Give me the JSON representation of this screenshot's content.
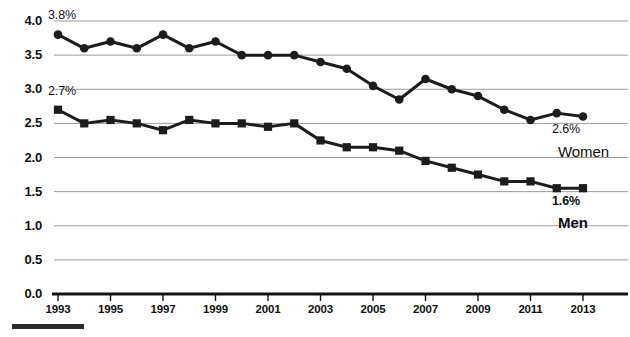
{
  "chart_data": {
    "type": "line",
    "title": "",
    "xlabel": "",
    "ylabel": "",
    "xlim": [
      1993,
      2013
    ],
    "ylim": [
      0.0,
      4.0
    ],
    "grid": true,
    "legend_position": "right-inline",
    "x": [
      1993,
      1994,
      1995,
      1996,
      1997,
      1998,
      1999,
      2000,
      2001,
      2002,
      2003,
      2004,
      2005,
      2006,
      2007,
      2008,
      2009,
      2010,
      2011,
      2012,
      2013
    ],
    "xtick_labels": [
      "1993",
      "1995",
      "1997",
      "1999",
      "2001",
      "2003",
      "2005",
      "2007",
      "2009",
      "2011",
      "2013"
    ],
    "xtick_values": [
      1993,
      1995,
      1997,
      1999,
      2001,
      2003,
      2005,
      2007,
      2009,
      2011,
      2013
    ],
    "ytick_labels": [
      "0.0",
      "0.5",
      "1.0",
      "1.5",
      "2.0",
      "2.5",
      "3.0",
      "3.5",
      "4.0"
    ],
    "ytick_values": [
      0.0,
      0.5,
      1.0,
      1.5,
      2.0,
      2.5,
      3.0,
      3.5,
      4.0
    ],
    "series": [
      {
        "name": "Women",
        "marker": "circle",
        "color": "#1c1c1c",
        "values": [
          3.8,
          3.6,
          3.7,
          3.6,
          3.8,
          3.6,
          3.7,
          3.5,
          3.5,
          3.5,
          3.4,
          3.3,
          3.05,
          2.85,
          3.15,
          3.0,
          2.9,
          2.7,
          2.55,
          2.65,
          2.6
        ],
        "start_label": "3.8%",
        "end_label": "2.6%"
      },
      {
        "name": "Men",
        "marker": "square",
        "color": "#1c1c1c",
        "values": [
          2.7,
          2.5,
          2.55,
          2.5,
          2.4,
          2.55,
          2.5,
          2.5,
          2.45,
          2.5,
          2.25,
          2.15,
          2.15,
          2.1,
          1.95,
          1.85,
          1.75,
          1.65,
          1.65,
          1.55,
          1.55
        ],
        "start_label": "2.7%",
        "end_label": "1.6%"
      }
    ],
    "annotations": [
      {
        "text": "3.8%",
        "x_px": 48,
        "y_px": 8,
        "bold": false
      },
      {
        "text": "2.7%",
        "x_px": 48,
        "y_px": 84,
        "bold": false
      },
      {
        "text": "2.6%",
        "x_px": 552,
        "y_px": 122,
        "bold": false
      },
      {
        "text": "Women",
        "x_px": 558,
        "y_px": 143,
        "bold": false
      },
      {
        "text": "1.6%",
        "x_px": 552,
        "y_px": 194,
        "bold": true
      },
      {
        "text": "Men",
        "x_px": 558,
        "y_px": 214,
        "bold": true
      }
    ]
  }
}
